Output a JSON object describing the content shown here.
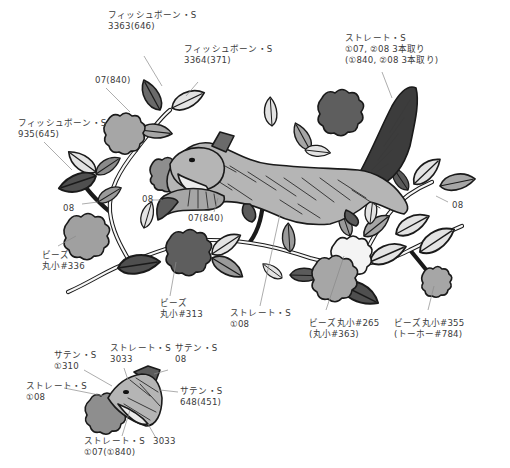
{
  "figure": {
    "type": "embroidery-pattern",
    "colors": {
      "leaf_light": "#e3e3e3",
      "leaf_mid": "#a6a6a6",
      "leaf_dark": "#5b5b5b",
      "flower_light": "#f4f4f4",
      "flower_mid": "#9e9e9e",
      "flower_dark": "#5e5e5e",
      "body": "#b5b5b5",
      "tail": "#3c3c3c",
      "outline": "#1a1a1a",
      "label_text": "#3a3a3a"
    }
  },
  "labels": {
    "fishbone_3363": {
      "line1": "フィッシュボーン・S",
      "line2": "3363(646)"
    },
    "fishbone_3364": {
      "line1": "フィッシュボーン・S",
      "line2": "3364(371)"
    },
    "stem_07": {
      "line1": "07(840)"
    },
    "tail_straight": {
      "line1": "ストレート・S",
      "line2": "①07, ②08  3本取り",
      "line3": "(①840, ②08  3本取り)"
    },
    "fishbone_935": {
      "line1": "フィッシュボーン・S",
      "line2": "935(645)"
    },
    "stem_08_left": {
      "line1": "08"
    },
    "squirrel_08": {
      "line1": "08"
    },
    "squirrel_07": {
      "line1": "07(840)"
    },
    "hind_08": {
      "line1": "08"
    },
    "beads_336": {
      "line1": "ビーズ",
      "line2": "丸小#336"
    },
    "beads_313": {
      "line1": "ビーズ",
      "line2": "丸小#313"
    },
    "body_straight": {
      "line1": "ストレート・S",
      "line2": "①08"
    },
    "beads_265": {
      "line1": "ビーズ丸小#265",
      "line2": "(丸小#363)"
    },
    "beads_355": {
      "line1": "ビーズ丸小#355",
      "line2": "(トーホー#784)"
    }
  },
  "detail": {
    "satin_310": {
      "line1": "サテン・S",
      "line2": "①310"
    },
    "straight_3033_top": {
      "line1": "ストレート・S",
      "line2": "3033"
    },
    "satin_08": {
      "line1": "サテン・S",
      "line2": "08"
    },
    "straight_08": {
      "line1": "ストレート・S",
      "line2": "①08"
    },
    "satin_648": {
      "line1": "サテン・S",
      "line2": "648(451)"
    },
    "straight_07": {
      "line1": "ストレート・S",
      "line2": "①07(①840)"
    },
    "num_3033": {
      "line1": "3033"
    }
  }
}
